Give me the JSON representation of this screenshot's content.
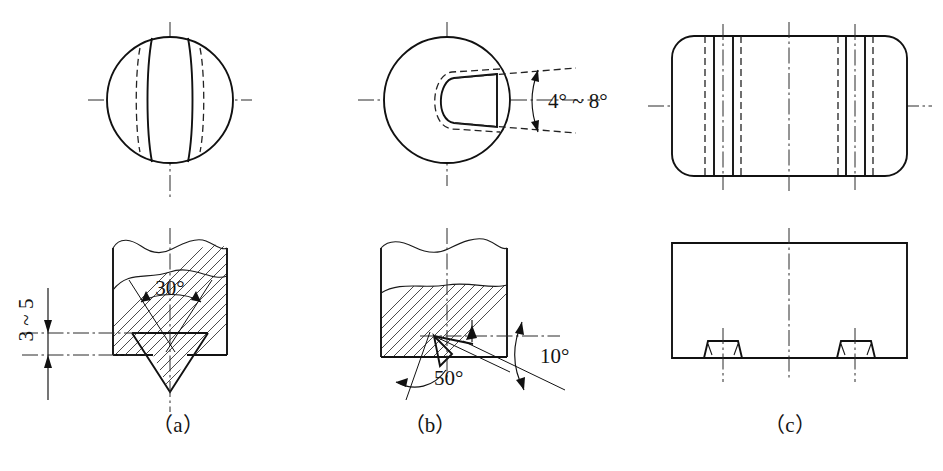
{
  "figure": {
    "width": 943,
    "height": 471,
    "background_color": "#ffffff",
    "line_color": "#111111",
    "panels": [
      {
        "id": "a",
        "caption": "（a）",
        "caption_x": 178,
        "caption_y": 432,
        "top_view": {
          "shape": "circle-with-straight-groove",
          "center_x": 170,
          "center_y": 100,
          "radius": 63
        },
        "front_view": {
          "shape": "round-bar-with-V-notch",
          "break_line": true,
          "hatched": true
        },
        "annotations": [
          {
            "name": "included-angle",
            "text": "30°",
            "x": 170,
            "y": 303,
            "kind": "angle"
          },
          {
            "name": "notch-depth",
            "text": "3 ~ 5",
            "x": 33,
            "y": 320,
            "kind": "linear",
            "rotated": true
          }
        ]
      },
      {
        "id": "b",
        "caption": "（b）",
        "caption_x": 430,
        "caption_y": 432,
        "top_view": {
          "shape": "circle-with-tapered-keyway",
          "center_x": 447,
          "center_y": 100,
          "radius": 63
        },
        "front_view": {
          "shape": "round-bar-with-inclined-notch",
          "break_line": true,
          "hatched": true
        },
        "annotations": [
          {
            "name": "keyway-taper-angle",
            "text": "4° ~ 8°",
            "x": 548,
            "y": 105,
            "kind": "angle"
          },
          {
            "name": "notch-included-angle",
            "text": "50°",
            "x": 434,
            "y": 385,
            "kind": "angle"
          },
          {
            "name": "notch-rake-angle",
            "text": "10°",
            "x": 540,
            "y": 363,
            "kind": "angle"
          }
        ]
      },
      {
        "id": "c",
        "caption": "（c）",
        "caption_x": 790,
        "caption_y": 432,
        "top_view": {
          "shape": "rounded-rectangle-with-two-groove-groups",
          "x": 672,
          "y": 36,
          "width": 235,
          "height": 140,
          "corner_radius": 22
        },
        "front_view": {
          "shape": "rectangle-with-two-dovetail-slots",
          "x": 672,
          "y": 243,
          "width": 235,
          "height": 115
        },
        "annotations": []
      }
    ],
    "legend_notes": {
      "outline": "visible edge",
      "hidden": "hidden edge (dashed)",
      "center": "axis / centre line (dash-dot)",
      "hatch": "section hatching"
    }
  }
}
